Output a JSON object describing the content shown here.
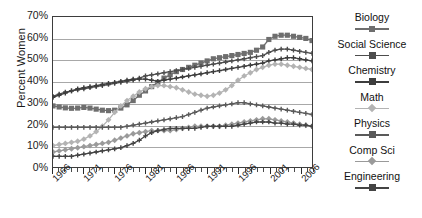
{
  "chart_data": {
    "type": "line",
    "title": "",
    "xlabel": "",
    "ylabel": "Percent Women",
    "ylim": [
      0,
      70
    ],
    "yticks": [
      "0%",
      "10%",
      "20%",
      "30%",
      "40%",
      "50%",
      "60%",
      "70%"
    ],
    "grid": true,
    "legend_position": "right",
    "xlim": [
      1966,
      2008
    ],
    "x": [
      1966,
      1967,
      1968,
      1969,
      1970,
      1971,
      1972,
      1973,
      1974,
      1975,
      1976,
      1977,
      1978,
      1979,
      1980,
      1981,
      1982,
      1983,
      1984,
      1985,
      1986,
      1987,
      1988,
      1989,
      1990,
      1991,
      1992,
      1993,
      1994,
      1995,
      1996,
      1997,
      1998,
      1999,
      2000,
      2001,
      2002,
      2003,
      2004,
      2005,
      2006,
      2007,
      2008
    ],
    "xtick_labels": [
      "1966",
      "1971",
      "1976",
      "1981",
      "1986",
      "1991",
      "1996",
      "2001",
      "2006"
    ],
    "xtick_values": [
      1966,
      1971,
      1976,
      1981,
      1986,
      1991,
      1996,
      2001,
      2006
    ],
    "series": [
      {
        "name": "Biology",
        "color": "#6e6e6e",
        "marker": "square",
        "values": [
          28.5,
          28.0,
          27.6,
          27.4,
          27.5,
          27.8,
          27.5,
          27.0,
          26.5,
          26.3,
          26.5,
          27.5,
          29.0,
          31.0,
          33.5,
          35.5,
          37.5,
          39.5,
          41.5,
          43.0,
          44.5,
          45.5,
          46.5,
          47.5,
          48.5,
          49.5,
          50.5,
          51.0,
          51.5,
          52.0,
          52.5,
          53.0,
          53.5,
          54.5,
          56.0,
          59.5,
          61.0,
          61.5,
          61.5,
          61.0,
          60.5,
          60.0,
          59.0
        ]
      },
      {
        "name": "Social Science",
        "color": "#4d4d4d",
        "marker": "cross",
        "values": [
          33.0,
          34.0,
          35.0,
          35.5,
          36.0,
          36.5,
          37.0,
          37.5,
          38.0,
          38.5,
          39.0,
          39.5,
          40.0,
          40.5,
          41.5,
          42.5,
          43.0,
          43.5,
          44.0,
          44.5,
          45.0,
          45.5,
          46.0,
          46.5,
          47.0,
          47.5,
          48.0,
          48.5,
          49.0,
          49.5,
          50.0,
          50.5,
          51.0,
          51.5,
          52.0,
          53.5,
          54.5,
          55.0,
          55.0,
          54.5,
          54.0,
          53.5,
          53.0
        ]
      },
      {
        "name": "Chemistry",
        "color": "#3d3d3d",
        "marker": "cross",
        "values": [
          32.5,
          33.5,
          34.5,
          35.5,
          36.5,
          37.0,
          37.5,
          38.0,
          38.5,
          39.0,
          39.5,
          40.0,
          40.5,
          41.0,
          41.0,
          41.0,
          40.5,
          40.0,
          40.5,
          41.0,
          41.5,
          42.0,
          42.5,
          43.0,
          43.5,
          44.0,
          44.5,
          45.0,
          45.5,
          46.0,
          46.5,
          47.0,
          47.5,
          48.0,
          48.5,
          49.5,
          50.0,
          50.5,
          51.0,
          51.0,
          50.5,
          50.0,
          49.5
        ]
      },
      {
        "name": "Math",
        "color": "#b3b3b3",
        "marker": "diamond",
        "values": [
          10.0,
          10.5,
          11.0,
          11.5,
          12.0,
          13.0,
          14.5,
          16.5,
          19.0,
          22.0,
          25.5,
          28.5,
          31.0,
          33.0,
          35.0,
          36.5,
          37.5,
          38.0,
          38.0,
          37.5,
          37.0,
          36.0,
          35.0,
          34.0,
          33.5,
          33.0,
          33.5,
          34.5,
          36.0,
          38.0,
          40.5,
          42.5,
          44.0,
          45.5,
          46.5,
          47.5,
          48.0,
          48.0,
          47.5,
          47.0,
          46.5,
          46.0,
          45.5
        ]
      },
      {
        "name": "Physics",
        "color": "#5a5a5a",
        "marker": "cross",
        "values": [
          18.5,
          18.5,
          18.5,
          18.5,
          18.5,
          18.5,
          18.5,
          18.5,
          18.5,
          18.5,
          18.5,
          18.5,
          19.0,
          19.5,
          20.0,
          20.5,
          21.0,
          21.5,
          22.0,
          22.5,
          23.0,
          23.5,
          24.5,
          25.5,
          26.5,
          27.5,
          28.0,
          28.5,
          29.0,
          29.5,
          30.0,
          30.0,
          29.5,
          29.0,
          28.5,
          28.0,
          27.5,
          27.0,
          26.5,
          26.0,
          25.5,
          25.0,
          24.5
        ]
      },
      {
        "name": "Comp Sci",
        "color": "#9a9a9a",
        "marker": "diamond",
        "values": [
          7.0,
          7.5,
          8.0,
          8.5,
          9.0,
          9.5,
          10.0,
          10.5,
          11.0,
          11.5,
          12.5,
          13.5,
          14.5,
          15.5,
          16.0,
          16.5,
          17.0,
          17.0,
          17.0,
          17.0,
          17.5,
          18.0,
          18.5,
          19.0,
          19.0,
          19.0,
          19.0,
          19.0,
          19.5,
          20.0,
          20.5,
          21.0,
          21.5,
          22.0,
          22.5,
          22.5,
          22.0,
          21.5,
          21.0,
          20.5,
          20.0,
          19.5,
          19.0
        ]
      },
      {
        "name": "Engineering",
        "color": "#444444",
        "marker": "cross",
        "values": [
          5.0,
          5.0,
          5.0,
          5.0,
          5.5,
          6.0,
          6.5,
          7.0,
          7.5,
          8.0,
          8.5,
          9.0,
          10.0,
          11.0,
          12.5,
          14.5,
          16.0,
          17.0,
          17.5,
          18.0,
          18.0,
          18.0,
          18.0,
          18.0,
          18.5,
          19.0,
          19.0,
          19.0,
          19.0,
          19.0,
          19.5,
          20.0,
          20.5,
          21.0,
          21.0,
          21.0,
          20.5,
          20.5,
          20.0,
          20.0,
          19.5,
          19.5,
          19.0
        ]
      }
    ]
  },
  "legend": {
    "items": [
      {
        "label": "Biology"
      },
      {
        "label": "Social Science"
      },
      {
        "label": "Chemistry"
      },
      {
        "label": "Math"
      },
      {
        "label": "Physics"
      },
      {
        "label": "Comp Sci"
      },
      {
        "label": "Engineering"
      }
    ]
  }
}
